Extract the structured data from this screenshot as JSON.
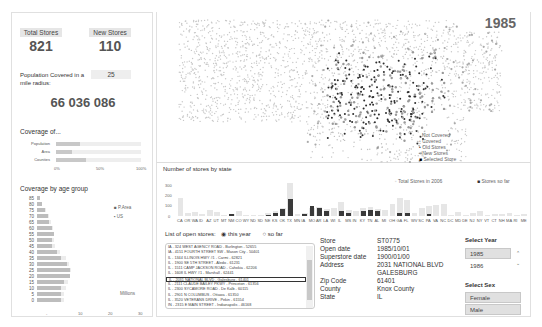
{
  "kpis": {
    "total_stores_label": "Total Stores",
    "total_stores_value": "821",
    "new_stores_label": "New Stores",
    "new_stores_value": "110",
    "population_label": "Population Covered in a mile radius:",
    "radius_value": "25",
    "population_value": "66 036 086"
  },
  "coverage": {
    "title": "Coverage of...",
    "rows": [
      {
        "label": "Population",
        "pct": 22
      },
      {
        "label": "Area",
        "pct": 13
      },
      {
        "label": "Counties",
        "pct": 28
      }
    ],
    "ticks": [
      "0%",
      "50%",
      "100%"
    ]
  },
  "age_chart": {
    "title": "Coverage by age group",
    "legend": [
      "P.Area",
      "US"
    ],
    "unit_label": "Millions",
    "ticks": [
      "-",
      "10",
      "20",
      "30"
    ]
  },
  "map": {
    "year": "1985",
    "legend": [
      "Not Covered",
      "Covered",
      "Old Stores",
      "New Stores",
      "Selected Store"
    ]
  },
  "state_chart": {
    "title": "Number of stores by state",
    "legend_total": "Total Stores in 2006",
    "legend_sofar": "Stores so far",
    "yticks": [
      "300",
      "200",
      "100",
      "0"
    ]
  },
  "chart_data": {
    "type": "bar",
    "title": "Number of stores by state",
    "categories": [
      "CA",
      "OR",
      "WA",
      "ID",
      "AZ",
      "UT",
      "MT",
      "NM",
      "CO",
      "WY",
      "ND",
      "SD",
      "NE",
      "KS",
      "OK",
      "TX",
      "MN",
      "IA",
      "MO",
      "AR",
      "LA",
      "WI",
      "IL",
      "MS",
      "IN",
      "KY",
      "TN",
      "AL",
      "MI",
      "OH",
      "GA",
      "FL",
      "WV",
      "SC",
      "PA",
      "VA",
      "NC",
      "DC",
      "MD",
      "DE",
      "NJ",
      "NY",
      "VT",
      "CT",
      "NH",
      "MA",
      "RI",
      "ME"
    ],
    "series": [
      {
        "name": "Total Stores in 2006",
        "values": [
          160,
          25,
          35,
          15,
          55,
          35,
          5,
          15,
          50,
          5,
          5,
          10,
          30,
          50,
          70,
          300,
          15,
          30,
          70,
          80,
          60,
          70,
          130,
          55,
          50,
          70,
          80,
          60,
          55,
          110,
          160,
          150,
          30,
          70,
          90,
          100,
          110,
          5,
          40,
          10,
          30,
          50,
          5,
          15,
          20,
          30,
          5,
          15
        ]
      },
      {
        "name": "Stores so far",
        "values": [
          0,
          0,
          0,
          0,
          0,
          0,
          0,
          15,
          0,
          0,
          0,
          0,
          10,
          30,
          60,
          155,
          0,
          20,
          90,
          70,
          50,
          0,
          45,
          30,
          0,
          50,
          55,
          45,
          0,
          0,
          30,
          30,
          0,
          0,
          20,
          0,
          0,
          0,
          0,
          0,
          0,
          0,
          0,
          0,
          0,
          0,
          0,
          0
        ]
      }
    ],
    "ylim": [
      0,
      300
    ],
    "legend_position": "top-right"
  },
  "store_list": {
    "label": "List of open stores:",
    "option_this_year": "this year",
    "option_so_far": "so far",
    "items": [
      "IA - 324 WEST AGENCY ROAD - Burlington - 52655",
      "IA - 4151 FOURTH STREET SW - Mason City - 50401",
      "IL - 1344 ILLINOIS HWY #1 - Carmi - 62821",
      "IL - 1900 SE 5TH STREET - Aledo - 61231",
      "IL - 1511 CAMP JACKSON ROAD - Cahokia - 62206",
      "IL - 1608 IL HWY #1 - Marshall - 62441",
      "IL - 2031 NATIONAL BLVD - Galesburg - 61401",
      "IL - 2111 CLAUDE BAILEY PKWY - Princeton - 61356",
      "IL - 2300 SYCAMORE ROAD - De Kalb - 60115",
      "IL - 2901 N COLUMBUS - Ottawa - 61350",
      "IL - 3520 VETERANS DRIVE - Pekin - 61554",
      "IN - 2315 E MAIN STREET - Indianapolis - 46168"
    ]
  },
  "store_detail": {
    "rows": [
      {
        "label": "Store",
        "value": "ST0775"
      },
      {
        "label": "Open date",
        "value": "1985/10/01"
      },
      {
        "label": "Superstore date",
        "value": "1900/01/00"
      },
      {
        "label": "Address",
        "value": "2031 NATIONAL BLVD"
      },
      {
        "label": "",
        "value": "GALESBURG"
      },
      {
        "label": "Zip Code",
        "value": "61401"
      },
      {
        "label": "County",
        "value": "Knox County"
      },
      {
        "label": "State",
        "value": "IL"
      }
    ]
  },
  "slicers": {
    "year_title": "Select Year",
    "years": [
      "1985",
      "1986"
    ],
    "sex_title": "Select Sex",
    "sexes": [
      "Female",
      "Male"
    ]
  }
}
